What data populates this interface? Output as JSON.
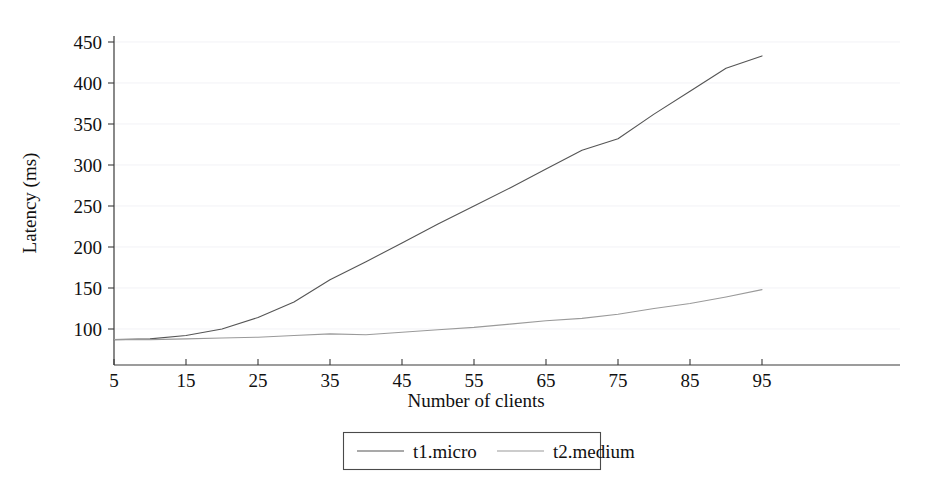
{
  "chart_data": {
    "type": "line",
    "title": "",
    "xlabel": "Number of clients",
    "ylabel": "Latency (ms)",
    "xlim": [
      5,
      95
    ],
    "ylim": [
      60,
      470
    ],
    "x": [
      5,
      10,
      15,
      20,
      25,
      30,
      35,
      40,
      45,
      50,
      55,
      60,
      65,
      70,
      75,
      80,
      85,
      90,
      95
    ],
    "xticks": [
      "5",
      "15",
      "25",
      "35",
      "45",
      "55",
      "65",
      "75",
      "85",
      "95"
    ],
    "xtick_values": [
      5,
      15,
      25,
      35,
      45,
      55,
      65,
      75,
      85,
      95
    ],
    "yticks": [
      "100",
      "150",
      "200",
      "250",
      "300",
      "350",
      "400",
      "450"
    ],
    "ytick_values": [
      100,
      150,
      200,
      250,
      300,
      350,
      400,
      450
    ],
    "grid": true,
    "legend_position": "bottom-center",
    "series": [
      {
        "name": "t1.micro",
        "color": "#555555",
        "values": [
          87,
          88,
          92,
          100,
          114,
          133,
          160,
          182,
          205,
          228,
          250,
          272,
          295,
          318,
          332,
          362,
          390,
          418,
          433
        ]
      },
      {
        "name": "t2.medium",
        "color": "#9a9a9a",
        "values": [
          87,
          87,
          88,
          89,
          90,
          92,
          94,
          93,
          96,
          99,
          102,
          106,
          110,
          113,
          118,
          125,
          131,
          139,
          148
        ]
      }
    ]
  },
  "axes": {
    "y_title": "Latency (ms)",
    "x_title": "Number of clients"
  },
  "legend": {
    "entries": [
      {
        "label": "t1.micro"
      },
      {
        "label": "t2.medium"
      }
    ]
  },
  "colors": {
    "series_1": "#555555",
    "series_2": "#9a9a9a",
    "axis": "#3a3a3a",
    "grid": "#ededf2",
    "background": "#ffffff"
  }
}
